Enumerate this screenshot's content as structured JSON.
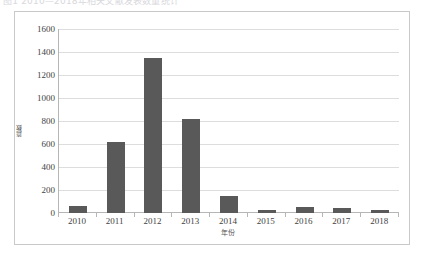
{
  "caption": {
    "text": "图1 2010—2018年相关文献发表数量统计"
  },
  "chart_data": {
    "type": "bar",
    "title": "",
    "categories": [
      "2010",
      "2011",
      "2012",
      "2013",
      "2014",
      "2015",
      "2016",
      "2017",
      "2018"
    ],
    "values": [
      60,
      620,
      1345,
      820,
      150,
      25,
      55,
      40,
      25
    ],
    "xlabel": "年份",
    "ylabel": "篇数",
    "ylim": [
      0,
      1600
    ],
    "ytick_step": 200,
    "yticks": [
      "1600",
      "1400",
      "1200",
      "1000",
      "800",
      "600",
      "400",
      "200",
      "0"
    ],
    "grid": "horizontal",
    "legend": "none",
    "bar_color": "#595959",
    "gridline_color": "#dddddd",
    "axis_color": "#b6b6b6",
    "border_color": "#c9c9c9",
    "background": "#ffffff"
  }
}
